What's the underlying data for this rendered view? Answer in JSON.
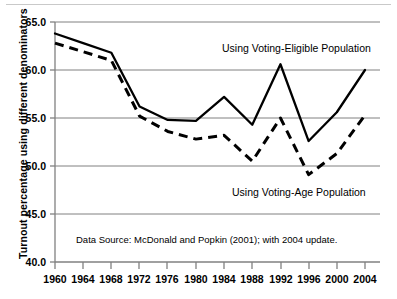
{
  "chart_data": {
    "type": "line",
    "title": "",
    "xlabel": "",
    "ylabel": "Turnout percentage using different denominators",
    "x": [
      1960,
      1964,
      1968,
      1972,
      1976,
      1980,
      1984,
      1988,
      1992,
      1996,
      2000,
      2004
    ],
    "categories": [
      "1960",
      "1964",
      "1968",
      "1972",
      "1976",
      "1980",
      "1984",
      "1988",
      "1992",
      "1996",
      "2000",
      "2004"
    ],
    "xlim": [
      1960,
      2004
    ],
    "ylim": [
      40.0,
      65.0
    ],
    "ytick_labels": [
      "65.0",
      "60.0",
      "55.0",
      "50.0",
      "45.0",
      "40.0"
    ],
    "ytick_values": [
      65.0,
      60.0,
      55.0,
      50.0,
      45.0,
      40.0
    ],
    "grid": "horizontal",
    "legend_position": "inline-annotations",
    "series": [
      {
        "name": "Using Voting-Eligible Population",
        "style": "solid",
        "color": "#000000",
        "values": [
          63.8,
          62.8,
          61.8,
          56.2,
          54.8,
          54.7,
          57.2,
          54.3,
          60.6,
          52.6,
          55.6,
          60.0
        ]
      },
      {
        "name": "Using Voting-Age Population",
        "style": "dashed",
        "color": "#000000",
        "values": [
          62.8,
          61.9,
          61.0,
          55.2,
          53.6,
          52.8,
          53.2,
          50.5,
          55.0,
          49.1,
          51.3,
          55.3
        ]
      }
    ],
    "annotations": [
      {
        "text": "Using Voting-Eligible Population",
        "x": 1987.5,
        "y": 62.0
      },
      {
        "text": "Using Voting-Age Population",
        "x": 1991.5,
        "y": 47.1
      },
      {
        "text": "Data Source: McDonald and Popkin (2001); with 2004 update.",
        "x": 1974.0,
        "y": 42.5
      }
    ]
  }
}
